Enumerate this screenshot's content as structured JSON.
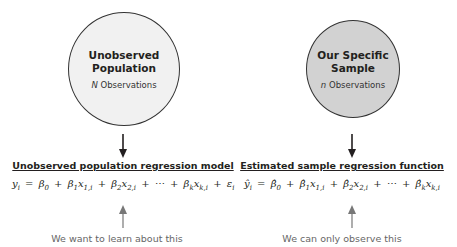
{
  "population": {
    "circle_title_line1": "Unobserved",
    "circle_title_line2": "Population",
    "circle_count_symbol": "N",
    "circle_count_label": " Observations",
    "fill_color": "#f1f1f1",
    "heading": "Unobserved population regression model",
    "equation": {
      "lhs": "y",
      "lhs_sub": "i",
      "equals": "=",
      "terms": [
        {
          "coef": "β",
          "coef_sub": "0",
          "var": "",
          "var_sub": ""
        },
        {
          "coef": "β",
          "coef_sub": "1",
          "var": "x",
          "var_sub": "1,i"
        },
        {
          "coef": "β",
          "coef_sub": "2",
          "var": "x",
          "var_sub": "2,i"
        },
        {
          "coef": "⋯",
          "coef_sub": "",
          "var": "",
          "var_sub": ""
        },
        {
          "coef": "β",
          "coef_sub": "k",
          "var": "x",
          "var_sub": "k,i"
        },
        {
          "coef": "ε",
          "coef_sub": "i",
          "var": "",
          "var_sub": ""
        }
      ],
      "plus": "+"
    },
    "caption": "We want to learn about this"
  },
  "sample": {
    "circle_title_line1": "Our Specific",
    "circle_title_line2": "Sample",
    "circle_count_symbol": "n",
    "circle_count_label": " Observations",
    "fill_color": "#d2d2d2",
    "heading": "Estimated sample regression function",
    "equation": {
      "lhs": "ŷ",
      "lhs_sub": "i",
      "equals": "=",
      "terms": [
        {
          "coef": "β̂",
          "coef_sub": "0",
          "var": "",
          "var_sub": ""
        },
        {
          "coef": "β̂",
          "coef_sub": "1",
          "var": "x",
          "var_sub": "1,i"
        },
        {
          "coef": "β̂",
          "coef_sub": "2",
          "var": "x",
          "var_sub": "2,i"
        },
        {
          "coef": "⋯",
          "coef_sub": "",
          "var": "",
          "var_sub": ""
        },
        {
          "coef": "β̂",
          "coef_sub": "k",
          "var": "x",
          "var_sub": "k,i"
        }
      ],
      "plus": "+"
    },
    "caption": "We can only observe this"
  }
}
